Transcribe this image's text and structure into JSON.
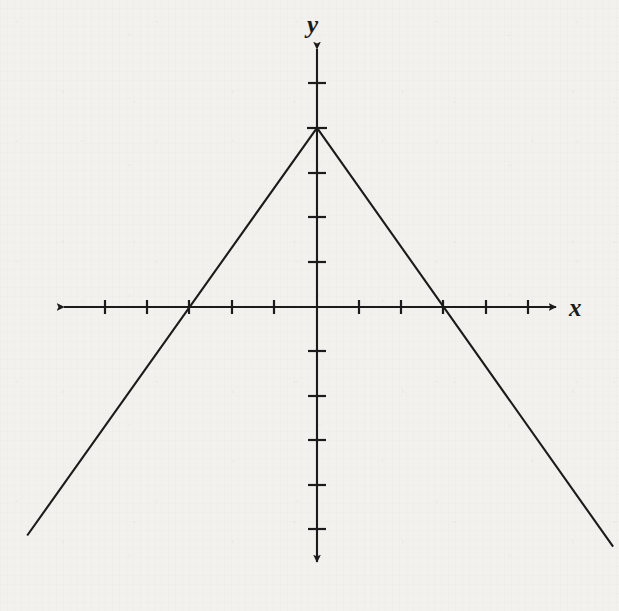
{
  "figure": {
    "kind": "cartesian-line-graph",
    "background_color": "#f2f1ee",
    "ink_color": "#1b1b1b",
    "x_axis_label": "x",
    "y_axis_label": "y"
  },
  "chart_data": {
    "type": "line",
    "title": "",
    "subtitle": "",
    "xlabel": "x",
    "ylabel": "y",
    "grid": false,
    "legend": null,
    "annotations": [],
    "axes": {
      "x": {
        "label": "x",
        "tick_labels": [],
        "tick_values": [
          -6,
          -5,
          -4,
          -3,
          -2,
          -1,
          0,
          1,
          2,
          3,
          4,
          5,
          6
        ],
        "tick_interval": 1,
        "arrow_both_ends": true,
        "xlim": [
          -6.25,
          6.25
        ]
      },
      "y": {
        "label": "y",
        "tick_labels": [],
        "tick_values": [
          -5,
          -4,
          -3,
          -2,
          -1,
          0,
          1,
          2,
          3,
          4,
          5,
          6
        ],
        "tick_interval": 1,
        "arrow_both_ends": true,
        "ylim": [
          -5.9,
          6.5
        ]
      }
    },
    "series": [
      {
        "name": "y = 4 - (4/3)|x|",
        "shape": "inverted-v",
        "vertex": [
          0,
          4
        ],
        "x_intercepts": [
          -3,
          3
        ],
        "y_intercept": 4,
        "left_slope": 1.3333,
        "right_slope": -1.3333,
        "points": [
          [
            -6.85,
            -5.1
          ],
          [
            0,
            4
          ],
          [
            7,
            -5.35
          ]
        ]
      }
    ]
  },
  "geometry_px": {
    "origin": [
      317,
      307
    ],
    "x_unit_px": 42.3,
    "y_unit_px": 44.8,
    "vertex_px": [
      317,
      128
    ],
    "x_crossings_px": [
      189,
      442
    ],
    "x_axis_arrow_left_px": [
      62,
      307
    ],
    "x_axis_arrow_right_px": [
      560,
      307
    ],
    "y_axis_arrow_top_px": [
      317,
      45
    ],
    "y_axis_arrow_bottom_px": [
      317,
      566
    ],
    "left_ray_end_px": [
      20,
      552
    ],
    "right_ray_end_px": [
      614,
      548
    ],
    "tick_half_len_px": 6,
    "line_width_px": 2
  }
}
